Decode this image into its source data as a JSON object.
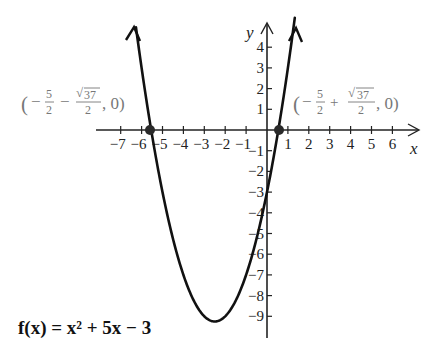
{
  "chart_data": {
    "type": "line",
    "title": "",
    "function_label": "f(x) = x² + 5x − 3",
    "xlabel": "x",
    "ylabel": "y",
    "xlim": [
      -7.8,
      6.5
    ],
    "ylim": [
      -10.1,
      4.8
    ],
    "grid": false,
    "x_ticks": [
      -7,
      -6,
      -5,
      -4,
      -3,
      -2,
      -1,
      1,
      2,
      3,
      4,
      5,
      6
    ],
    "y_ticks": [
      4,
      3,
      2,
      1,
      -1,
      -2,
      -3,
      -4,
      -5,
      -6,
      -7,
      -8,
      -9
    ],
    "x_tick_labels": [
      "−7",
      "−6",
      "−5",
      "−4",
      "−3",
      "−2",
      "−1",
      "1",
      "2",
      "3",
      "4",
      "5",
      "6"
    ],
    "y_tick_labels": [
      "4",
      "3",
      "2",
      "1",
      "−1",
      "−2",
      "−3",
      "−4",
      "−5",
      "−6",
      "−7",
      "−8",
      "−9"
    ],
    "series": [
      {
        "name": "f(x) = x^2 + 5x - 3",
        "coefficients": {
          "a": 1,
          "b": 5,
          "c": -3
        },
        "x": [
          -6.27,
          -6,
          -5.54,
          -5,
          -4,
          -3,
          -2.5,
          -2,
          -1,
          0,
          0.54,
          1,
          1.3
        ],
        "y": [
          5.0,
          3,
          0,
          -3,
          -7,
          -9,
          -9.25,
          -9,
          -7,
          -3,
          0,
          3,
          5.2
        ]
      }
    ],
    "annotations": [
      {
        "label": "(−5/2 − √37/2, 0)",
        "x": -5.54,
        "y": 0,
        "marker": "dot"
      },
      {
        "label": "(−5/2 + √37/2, 0)",
        "x": 0.54,
        "y": 0,
        "marker": "dot"
      }
    ],
    "vertex": {
      "x": -2.5,
      "y": -9.25
    }
  },
  "labels": {
    "x_axis": "x",
    "y_axis": "y",
    "left_root": {
      "open": "(",
      "minus1": "−",
      "num1": "5",
      "den1": "2",
      "minus2": "−",
      "sqrt": "√",
      "radicand": "37",
      "den2": "2",
      "tail": ", 0)"
    },
    "right_root": {
      "open": "(",
      "minus1": "−",
      "num1": "5",
      "den1": "2",
      "plus": "+",
      "sqrt": "√",
      "radicand": "37",
      "den2": "2",
      "tail": ", 0)"
    },
    "function": "f(x) = x² + 5x − 3"
  },
  "colors": {
    "curve": "#111111",
    "axis": "#222222",
    "point_label": "#777777",
    "dot": "#2a2a2a"
  }
}
